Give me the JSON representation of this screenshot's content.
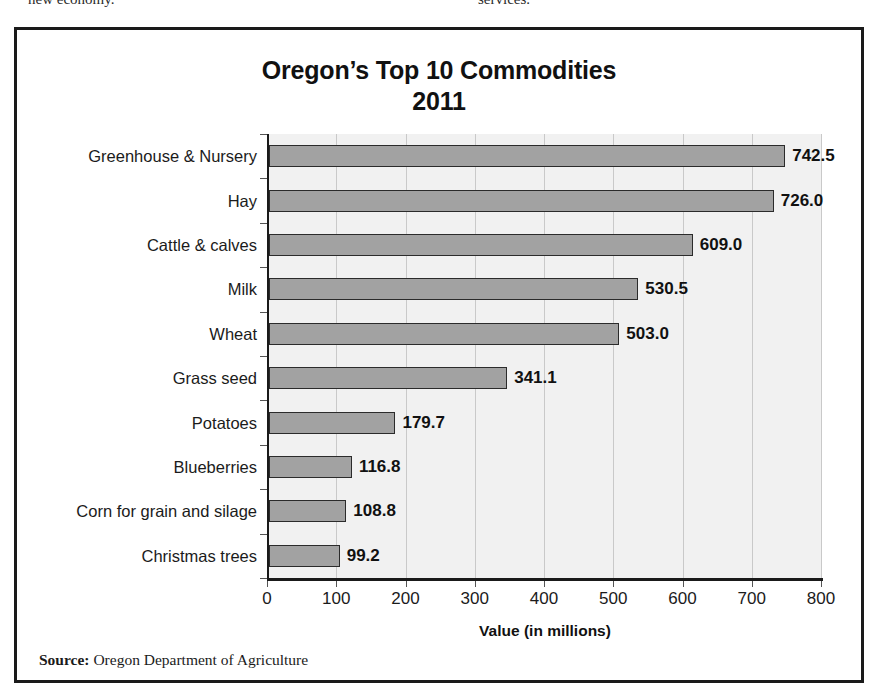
{
  "page_text": {
    "left_fragment": "new economy.",
    "right_fragment": "services."
  },
  "figure": {
    "title_line1": "Oregon’s Top 10 Commodities",
    "title_line2": "2011",
    "source_label": "Source:",
    "source_text": "Oregon Department of Agriculture"
  },
  "chart_data": {
    "type": "bar",
    "orientation": "horizontal",
    "title": "Oregon’s Top 10 Commodities 2011",
    "xlabel": "Value (in millions)",
    "ylabel": "",
    "xlim": [
      0,
      800
    ],
    "xticks": [
      0,
      100,
      200,
      300,
      400,
      500,
      600,
      700,
      800
    ],
    "xtick_labels": [
      "0",
      "100",
      "200",
      "300",
      "400",
      "500",
      "600",
      "700",
      "800"
    ],
    "grid": "vertical",
    "legend": "none",
    "categories": [
      "Greenhouse & Nursery",
      "Hay",
      "Cattle & calves",
      "Milk",
      "Wheat",
      "Grass seed",
      "Potatoes",
      "Blueberries",
      "Corn for grain and silage",
      "Christmas trees"
    ],
    "values": [
      742.5,
      726.0,
      609.0,
      530.5,
      503.0,
      341.1,
      179.7,
      116.8,
      108.8,
      99.2
    ],
    "value_labels": [
      "742.5",
      "726.0",
      "609.0",
      "530.5",
      "503.0",
      "341.1",
      "179.7",
      "116.8",
      "108.8",
      "99.2"
    ],
    "bar_color": "#a2a2a2",
    "bar_edge_color": "#2b2b2b",
    "plot_background": "#f1f1f1",
    "gridline_color": "#c9c9c9"
  }
}
